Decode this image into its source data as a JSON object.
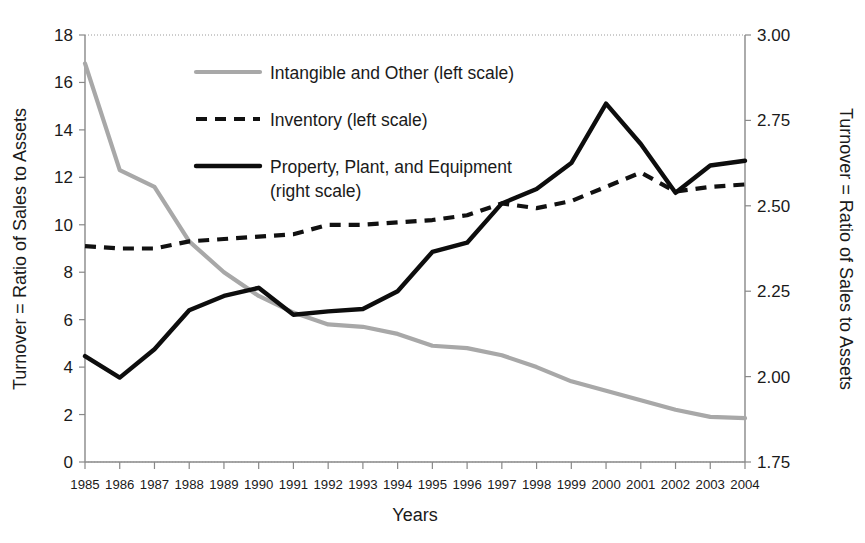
{
  "chart_data": {
    "type": "line",
    "title": "",
    "xlabel": "Years",
    "ylabel": "Turnover = Ratio of Sales to Assets",
    "ylabel_right": "Turnover = Ratio of Sales to Assets",
    "grid": false,
    "legend_position": "upper-center-inside",
    "x": [
      1985,
      1986,
      1987,
      1988,
      1989,
      1990,
      1991,
      1992,
      1993,
      1994,
      1995,
      1996,
      1997,
      1998,
      1999,
      2000,
      2001,
      2002,
      2003,
      2004
    ],
    "categories": [
      "1985",
      "1986",
      "1987",
      "1988",
      "1989",
      "1990",
      "1991",
      "1992",
      "1993",
      "1994",
      "1995",
      "1996",
      "1997",
      "1998",
      "1999",
      "2000",
      "2001",
      "2002",
      "2003",
      "2004"
    ],
    "ylim": [
      0,
      18
    ],
    "yticks": [
      0,
      2,
      4,
      6,
      8,
      10,
      12,
      14,
      16,
      18
    ],
    "yticklabels": [
      "0",
      "2",
      "4",
      "6",
      "8",
      "10",
      "12",
      "14",
      "16",
      "18"
    ],
    "ylim_right": [
      1.75,
      3.0
    ],
    "yticks_right": [
      1.75,
      2.0,
      2.25,
      2.5,
      2.75,
      3.0
    ],
    "yticklabels_right": [
      "1.75",
      "2.00",
      "2.25",
      "2.50",
      "2.75",
      "3.00"
    ],
    "series": [
      {
        "name": "Intangible and Other (left scale)",
        "axis": "left",
        "style": "solid-gray",
        "color": "#a8a8a8",
        "values": [
          16.8,
          12.3,
          11.6,
          9.3,
          8.0,
          7.0,
          6.3,
          5.8,
          5.7,
          5.4,
          4.9,
          4.8,
          4.5,
          4.0,
          3.4,
          3.0,
          2.6,
          2.2,
          1.9,
          1.85
        ]
      },
      {
        "name": "Inventory (left scale)",
        "axis": "left",
        "style": "dashed-black",
        "color": "#111111",
        "values": [
          9.1,
          9.0,
          9.0,
          9.3,
          9.4,
          9.5,
          9.6,
          10.0,
          10.0,
          10.1,
          10.2,
          10.4,
          10.9,
          10.7,
          11.0,
          11.6,
          12.2,
          11.4,
          11.6,
          11.7
        ]
      },
      {
        "name": "Property, Plant, and Equipment (right scale)",
        "axis": "right",
        "style": "solid-black",
        "color": "#0d0d0d",
        "values_left_equivalent": [
          4.45,
          3.55,
          4.75,
          6.4,
          7.0,
          7.35,
          6.2,
          6.35,
          6.45,
          7.2,
          8.85,
          9.25,
          10.9,
          11.5,
          12.6,
          15.1,
          13.4,
          11.35,
          12.5,
          12.7
        ],
        "values": [
          2.06,
          1.997,
          2.08,
          2.194,
          2.236,
          2.26,
          2.181,
          2.191,
          2.198,
          2.25,
          2.365,
          2.392,
          2.507,
          2.549,
          2.625,
          2.799,
          2.681,
          2.538,
          2.618,
          2.632
        ]
      }
    ],
    "legend": [
      {
        "label": "Intangible and Other (left scale)",
        "style": "solid-gray"
      },
      {
        "label": "Inventory (left scale)",
        "style": "dashed-black"
      },
      {
        "label": "Property, Plant, and Equipment",
        "style": "solid-black"
      },
      {
        "label": "(right scale)",
        "style": "none"
      }
    ]
  },
  "axes": {
    "x_title": "Years",
    "y_left_title": "Turnover = Ratio of Sales to Assets",
    "y_right_title": "Turnover = Ratio of Sales to Assets"
  },
  "colors": {
    "gray_series": "#a8a8a8",
    "black_series": "#0d0d0d",
    "axis": "#888888",
    "text": "#1a1a1a",
    "background": "#ffffff"
  }
}
